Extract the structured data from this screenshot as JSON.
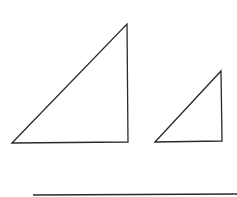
{
  "diagram": {
    "stroke_color": "#2a2a2a",
    "large_triangle": {
      "points": "12,143 127,24 128,142"
    },
    "small_triangle": {
      "points": "155,142 221,71 222,141"
    },
    "answer_line": {
      "x1": 33,
      "y1": 195,
      "x2": 237,
      "y2": 194
    }
  }
}
